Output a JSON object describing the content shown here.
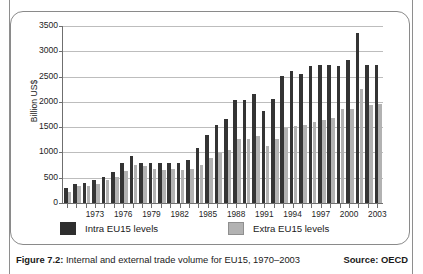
{
  "chart_data": {
    "type": "bar",
    "title": "",
    "xlabel": "",
    "ylabel": "Billion US$",
    "ylim": [
      0,
      3500
    ],
    "ytick_labels": [
      "0",
      "500",
      "1000",
      "1500",
      "2000",
      "2500",
      "3000",
      "3500"
    ],
    "ytick_values": [
      0,
      500,
      1000,
      1500,
      2000,
      2500,
      3000,
      3500
    ],
    "grid": true,
    "legend_position": "below-plot",
    "categories": [
      "1970",
      "1971",
      "1972",
      "1973",
      "1974",
      "1975",
      "1976",
      "1977",
      "1978",
      "1979",
      "1980",
      "1981",
      "1982",
      "1983",
      "1984",
      "1985",
      "1986",
      "1987",
      "1988",
      "1989",
      "1990",
      "1991",
      "1992",
      "1993",
      "1994",
      "1995",
      "1996",
      "1997",
      "1998",
      "1999",
      "2000",
      "2001",
      "2002",
      "2003"
    ],
    "xtick_labels": [
      "1973",
      "1976",
      "1979",
      "1982",
      "1985",
      "1988",
      "1991",
      "1994",
      "1997",
      "2000",
      "2003"
    ],
    "xtick_categories": [
      "1973",
      "1976",
      "1979",
      "1982",
      "1985",
      "1988",
      "1991",
      "1994",
      "1997",
      "2000",
      "2003"
    ],
    "series": [
      {
        "name": "Intra EU15 levels",
        "color": "#343434",
        "values": [
          300,
          385,
          390,
          455,
          505,
          610,
          800,
          930,
          800,
          790,
          785,
          795,
          790,
          860,
          1095,
          1350,
          1550,
          1670,
          2040,
          2040,
          2155,
          1815,
          2065,
          2510,
          2610,
          2545,
          2710,
          2730,
          2720,
          2715,
          2825,
          3370,
          2720,
          2730
        ]
      },
      {
        "name": "Extra EU15 levels",
        "color": "#b2b2b2",
        "values": [
          225,
          330,
          340,
          385,
          450,
          505,
          635,
          760,
          730,
          680,
          660,
          670,
          645,
          670,
          760,
          890,
          980,
          1050,
          1275,
          1270,
          1320,
          1130,
          1260,
          1485,
          1520,
          1545,
          1600,
          1650,
          1685,
          1850,
          1855,
          2255,
          1935,
          1950
        ]
      }
    ],
    "bars": [
      {
        "year": "1970",
        "intra": 300,
        "extra": 225
      },
      {
        "year": "1971",
        "intra": 385,
        "extra": 330
      },
      {
        "year": "1972",
        "intra": 390,
        "extra": 340
      },
      {
        "year": "1973",
        "intra": 455,
        "extra": 385
      },
      {
        "year": "1974",
        "intra": 505,
        "extra": 450
      },
      {
        "year": "1975",
        "intra": 610,
        "extra": 505
      },
      {
        "year": "1976",
        "intra": 800,
        "extra": 635
      },
      {
        "year": "1977",
        "intra": 930,
        "extra": 760
      },
      {
        "year": "1978",
        "intra": 800,
        "extra": 730
      },
      {
        "year": "1979",
        "intra": 790,
        "extra": 680
      },
      {
        "year": "1980",
        "intra": 785,
        "extra": 660
      },
      {
        "year": "1981",
        "intra": 795,
        "extra": 670
      },
      {
        "year": "1982",
        "intra": 790,
        "extra": 645
      },
      {
        "year": "1983",
        "intra": 860,
        "extra": 670
      },
      {
        "year": "1984",
        "intra": 1095,
        "extra": 760
      },
      {
        "year": "1985",
        "intra": 1350,
        "extra": 890
      },
      {
        "year": "1986",
        "intra": 1550,
        "extra": 980
      },
      {
        "year": "1987",
        "intra": 1670,
        "extra": 1050
      },
      {
        "year": "1988",
        "intra": 2040,
        "extra": 1275
      },
      {
        "year": "1989",
        "intra": 2040,
        "extra": 1270
      },
      {
        "year": "1990",
        "intra": 2155,
        "extra": 1320
      },
      {
        "year": "1991",
        "intra": 1815,
        "extra": 1130
      },
      {
        "year": "1992",
        "intra": 2065,
        "extra": 1260
      },
      {
        "year": "1993",
        "intra": 2510,
        "extra": 1485
      },
      {
        "year": "1994",
        "intra": 2610,
        "extra": 1520
      },
      {
        "year": "1995",
        "intra": 2545,
        "extra": 1545
      },
      {
        "year": "1996",
        "intra": 2710,
        "extra": 1600
      },
      {
        "year": "1997",
        "intra": 2730,
        "extra": 1650
      },
      {
        "year": "1998",
        "intra": 2720,
        "extra": 1685
      },
      {
        "year": "1999",
        "intra": 2715,
        "extra": 1850
      },
      {
        "year": "2000",
        "intra": 2825,
        "extra": 1855
      },
      {
        "year": "2001",
        "intra": 3370,
        "extra": 2255
      },
      {
        "year": "2002",
        "intra": 2720,
        "extra": 1935
      },
      {
        "year": "2003",
        "intra": 2730,
        "extra": 1950
      }
    ]
  },
  "legend": {
    "items": [
      {
        "label": "Intra EU15 levels",
        "color": "#2e2e2e"
      },
      {
        "label": "Extra EU15 levels",
        "color": "#b2b2b2"
      }
    ]
  },
  "caption": {
    "figure_number": "Figure 7.2:",
    "text": " Internal and external trade volume for EU15, 1970–2003",
    "source": "Source: OECD"
  }
}
